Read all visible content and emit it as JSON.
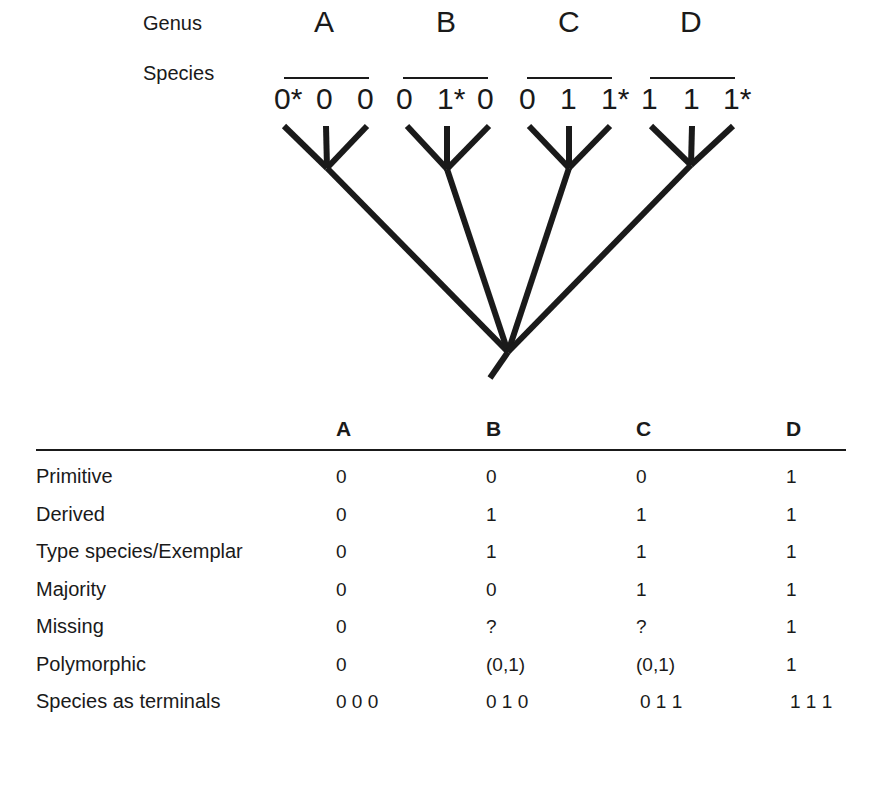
{
  "diagram": {
    "header_labels": {
      "genus": "Genus",
      "species": "Species"
    },
    "genera": [
      {
        "name": "A",
        "species": [
          "0*",
          "0",
          "0"
        ]
      },
      {
        "name": "B",
        "species": [
          "0",
          "1*",
          "0"
        ]
      },
      {
        "name": "C",
        "species": [
          "0",
          "1",
          "1*"
        ]
      },
      {
        "name": "D",
        "species": [
          "1",
          "1",
          "1*"
        ]
      }
    ],
    "tree": {
      "type": "phylogenetic-tree",
      "root": [
        508,
        352
      ],
      "stem_end": [
        490,
        378
      ],
      "nodes": [
        {
          "genus": "A",
          "node": [
            327,
            168
          ],
          "tips": [
            [
              284,
              126
            ],
            [
              326,
              126
            ],
            [
              367,
              126
            ]
          ]
        },
        {
          "genus": "B",
          "node": [
            447,
            169
          ],
          "tips": [
            [
              407,
              126
            ],
            [
              447,
              126
            ],
            [
              489,
              126
            ]
          ]
        },
        {
          "genus": "C",
          "node": [
            569,
            168
          ],
          "tips": [
            [
              529,
              126
            ],
            [
              569,
              126
            ],
            [
              610,
              126
            ]
          ]
        },
        {
          "genus": "D",
          "node": [
            691,
            165
          ],
          "tips": [
            [
              651,
              126
            ],
            [
              692,
              126
            ],
            [
              733,
              126
            ]
          ]
        }
      ],
      "line_color": "#1a1a1a"
    }
  },
  "table": {
    "columns": [
      "A",
      "B",
      "C",
      "D"
    ],
    "rows": [
      {
        "label": "Primitive",
        "values": [
          "0",
          "0",
          "0",
          "1"
        ]
      },
      {
        "label": "Derived",
        "values": [
          "0",
          "1",
          "1",
          "1"
        ]
      },
      {
        "label": "Type species/Exemplar",
        "values": [
          "0",
          "1",
          "1",
          "1"
        ]
      },
      {
        "label": "Majority",
        "values": [
          "0",
          "0",
          "1",
          "1"
        ]
      },
      {
        "label": "Missing",
        "values": [
          "0",
          "?",
          "?",
          "1"
        ]
      },
      {
        "label": "Polymorphic",
        "values": [
          "0",
          "(0,1)",
          "(0,1)",
          "1"
        ]
      },
      {
        "label": "Species as terminals",
        "values": [
          "0 0 0",
          "0 1 0",
          "0 1 1",
          "1 1 1"
        ]
      }
    ]
  }
}
